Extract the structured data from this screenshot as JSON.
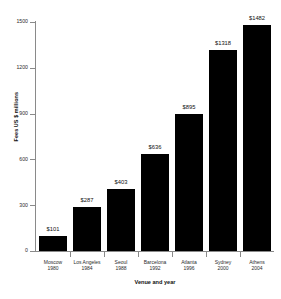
{
  "chart_data": {
    "type": "bar",
    "title": "",
    "xlabel": "Venue and year",
    "ylabel": "Fees US $ millions",
    "categories": [
      "Moscow 1980",
      "Los Angeles 1984",
      "Seoul 1988",
      "Barcelona 1992",
      "Atlanta 1996",
      "Sydney 2000",
      "Athens 2004"
    ],
    "category_venues": [
      "Moscow",
      "Los Angeles",
      "Seoul",
      "Barcelona",
      "Atlanta",
      "Sydney",
      "Athens"
    ],
    "category_years": [
      "1980",
      "1984",
      "1988",
      "1992",
      "1996",
      "2000",
      "2004"
    ],
    "values": [
      101,
      287,
      403,
      636,
      895,
      1318,
      1482
    ],
    "value_labels": [
      "$101",
      "$287",
      "$403",
      "$636",
      "$895",
      "$1318",
      "$1482"
    ],
    "ylim": [
      0,
      1500
    ],
    "ytick_labels": [
      "0",
      "300",
      "600",
      "900",
      "1200",
      "1500"
    ],
    "ytick_values": [
      0,
      300,
      600,
      900,
      1200,
      1500
    ],
    "grid": false,
    "legend": false,
    "bar_color": "#000000",
    "axis_color": "#8a8a8a",
    "background_color": "#ffffff"
  }
}
